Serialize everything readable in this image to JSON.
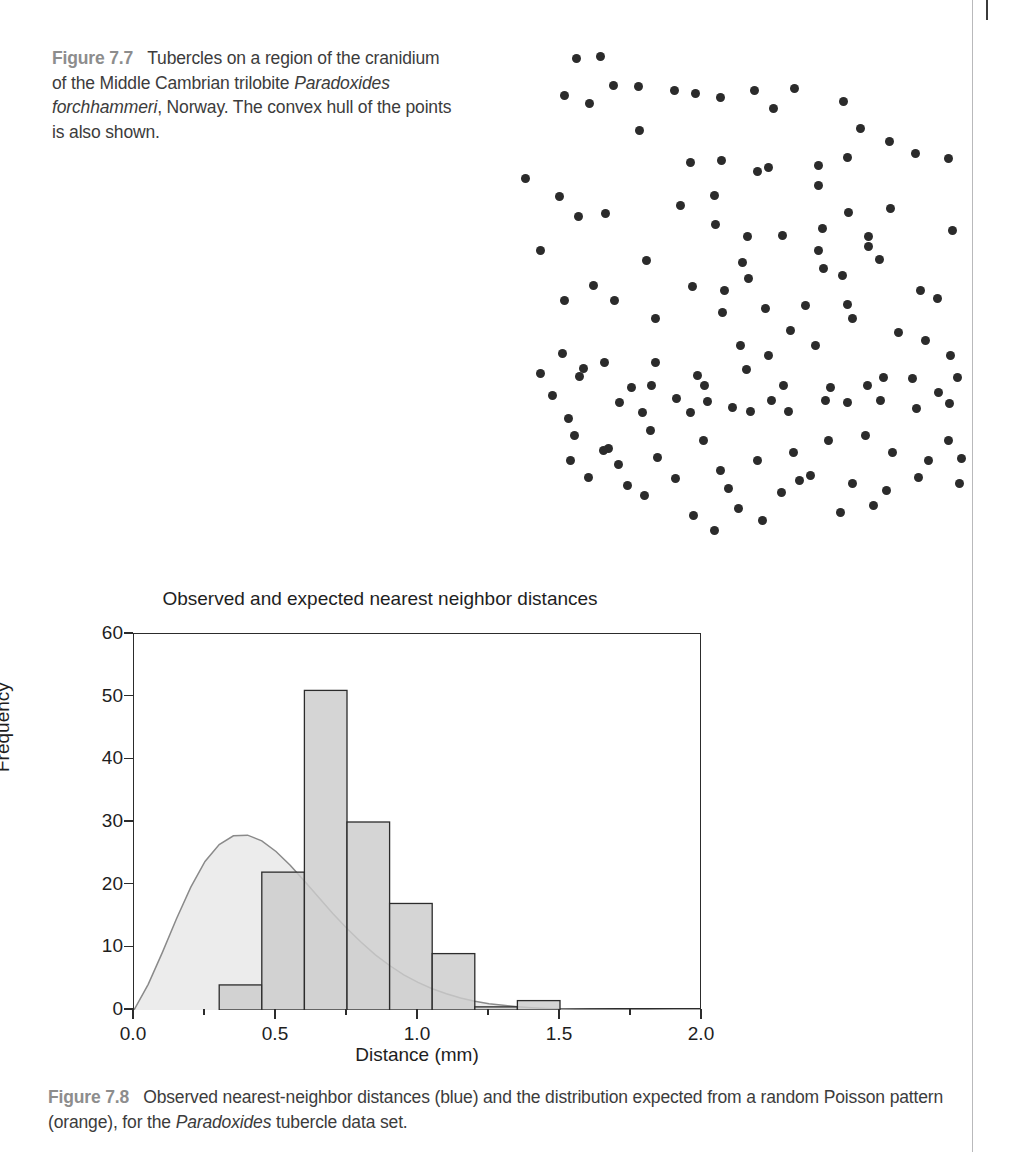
{
  "figure_77": {
    "label": "Figure 7.7",
    "caption_part1": "Tubercles on a region of the cranidium of the Middle Cambrian trilobite ",
    "caption_species": "Paradoxides forchhammeri",
    "caption_part2": ", Norway. The convex hull of the points is also shown.",
    "point_color": "#2b2b2b",
    "points": [
      [
        76,
        18
      ],
      [
        100,
        16
      ],
      [
        113,
        45
      ],
      [
        138,
        46
      ],
      [
        64,
        55
      ],
      [
        89,
        63
      ],
      [
        139,
        90
      ],
      [
        174,
        50
      ],
      [
        195,
        53
      ],
      [
        220,
        57
      ],
      [
        254,
        50
      ],
      [
        273,
        68
      ],
      [
        294,
        48
      ],
      [
        343,
        61
      ],
      [
        25,
        138
      ],
      [
        190,
        122
      ],
      [
        221,
        120
      ],
      [
        257,
        131
      ],
      [
        268,
        127
      ],
      [
        318,
        125
      ],
      [
        347,
        117
      ],
      [
        360,
        88
      ],
      [
        389,
        101
      ],
      [
        415,
        113
      ],
      [
        448,
        118
      ],
      [
        59,
        156
      ],
      [
        318,
        145
      ],
      [
        390,
        168
      ],
      [
        78,
        176
      ],
      [
        105,
        173
      ],
      [
        180,
        165
      ],
      [
        214,
        155
      ],
      [
        215,
        184
      ],
      [
        247,
        196
      ],
      [
        282,
        195
      ],
      [
        322,
        188
      ],
      [
        348,
        172
      ],
      [
        368,
        196
      ],
      [
        452,
        190
      ],
      [
        40,
        210
      ],
      [
        242,
        222
      ],
      [
        318,
        210
      ],
      [
        368,
        206
      ],
      [
        146,
        220
      ],
      [
        224,
        250
      ],
      [
        248,
        238
      ],
      [
        323,
        228
      ],
      [
        342,
        235
      ],
      [
        379,
        219
      ],
      [
        192,
        246
      ],
      [
        64,
        260
      ],
      [
        93,
        245
      ],
      [
        114,
        260
      ],
      [
        155,
        278
      ],
      [
        222,
        272
      ],
      [
        265,
        268
      ],
      [
        305,
        265
      ],
      [
        347,
        264
      ],
      [
        352,
        278
      ],
      [
        420,
        250
      ],
      [
        437,
        258
      ],
      [
        290,
        290
      ],
      [
        315,
        305
      ],
      [
        398,
        292
      ],
      [
        240,
        305
      ],
      [
        268,
        315
      ],
      [
        155,
        322
      ],
      [
        83,
        328
      ],
      [
        62,
        313
      ],
      [
        79,
        336
      ],
      [
        104,
        322
      ],
      [
        151,
        345
      ],
      [
        197,
        335
      ],
      [
        246,
        329
      ],
      [
        283,
        345
      ],
      [
        330,
        347
      ],
      [
        367,
        345
      ],
      [
        383,
        337
      ],
      [
        412,
        338
      ],
      [
        425,
        300
      ],
      [
        450,
        315
      ],
      [
        131,
        347
      ],
      [
        176,
        358
      ],
      [
        204,
        345
      ],
      [
        232,
        367
      ],
      [
        40,
        333
      ],
      [
        119,
        362
      ],
      [
        142,
        372
      ],
      [
        150,
        390
      ],
      [
        207,
        361
      ],
      [
        271,
        360
      ],
      [
        288,
        371
      ],
      [
        347,
        362
      ],
      [
        380,
        360
      ],
      [
        438,
        352
      ],
      [
        457,
        337
      ],
      [
        449,
        363
      ],
      [
        52,
        355
      ],
      [
        68,
        378
      ],
      [
        74,
        395
      ],
      [
        108,
        408
      ],
      [
        190,
        372
      ],
      [
        250,
        371
      ],
      [
        325,
        360
      ],
      [
        365,
        395
      ],
      [
        416,
        368
      ],
      [
        70,
        420
      ],
      [
        103,
        410
      ],
      [
        118,
        424
      ],
      [
        157,
        417
      ],
      [
        203,
        400
      ],
      [
        220,
        430
      ],
      [
        257,
        420
      ],
      [
        293,
        412
      ],
      [
        310,
        435
      ],
      [
        328,
        400
      ],
      [
        392,
        412
      ],
      [
        428,
        420
      ],
      [
        448,
        400
      ],
      [
        461,
        418
      ],
      [
        88,
        437
      ],
      [
        127,
        445
      ],
      [
        144,
        455
      ],
      [
        175,
        438
      ],
      [
        228,
        448
      ],
      [
        238,
        468
      ],
      [
        281,
        452
      ],
      [
        299,
        440
      ],
      [
        352,
        443
      ],
      [
        386,
        450
      ],
      [
        418,
        437
      ],
      [
        459,
        443
      ],
      [
        193,
        475
      ],
      [
        214,
        490
      ],
      [
        262,
        480
      ],
      [
        340,
        472
      ],
      [
        373,
        465
      ]
    ]
  },
  "chart_data": {
    "type": "bar",
    "title": "Observed and expected nearest neighbor distances",
    "xlabel": "Distance (mm)",
    "ylabel": "Frequency",
    "xlim": [
      0.0,
      2.0
    ],
    "ylim": [
      0,
      60
    ],
    "grid": false,
    "legend_position": "none",
    "x_tick_labels": [
      "0.0",
      "0.5",
      "1.0",
      "1.5",
      "2.0"
    ],
    "x_tick_values": [
      0.0,
      0.5,
      1.0,
      1.5,
      2.0
    ],
    "x_minor_tick_values": [
      0.25,
      0.75,
      1.25,
      1.75
    ],
    "y_tick_labels": [
      "0",
      "10",
      "20",
      "30",
      "40",
      "50",
      "60"
    ],
    "y_tick_values": [
      0,
      10,
      20,
      30,
      40,
      50,
      60
    ],
    "bar_fill_color": "#cccccc",
    "bar_edge_color": "#2c2c2c",
    "curve_fill_color": "#ececec",
    "curve_line_color": "#8a8a8a",
    "bin_width": 0.15,
    "bin_edges": [
      0.3,
      0.45,
      0.6,
      0.75,
      0.9,
      1.05,
      1.2,
      1.35,
      1.5
    ],
    "categories": [
      "0.30-0.45",
      "0.45-0.60",
      "0.60-0.75",
      "0.75-0.90",
      "0.90-1.05",
      "1.05-1.20",
      "1.20-1.35",
      "1.35-1.50"
    ],
    "values": [
      4,
      22,
      51,
      30,
      17,
      9,
      0.5,
      1.5
    ],
    "series": [
      {
        "name": "Observed nearest-neighbor distances",
        "type": "bar",
        "values": [
          4,
          22,
          51,
          30,
          17,
          9,
          0.5,
          1.5
        ]
      },
      {
        "name": "Expected from random Poisson pattern",
        "type": "area",
        "x": [
          0.0,
          0.05,
          0.1,
          0.15,
          0.2,
          0.25,
          0.3,
          0.35,
          0.4,
          0.45,
          0.5,
          0.55,
          0.6,
          0.65,
          0.7,
          0.75,
          0.8,
          0.85,
          0.9,
          0.95,
          1.0,
          1.05,
          1.1,
          1.15,
          1.2,
          1.25,
          1.3,
          1.35,
          1.4,
          1.45,
          1.5,
          1.6,
          1.7,
          1.8,
          1.9,
          2.0
        ],
        "y": [
          0.0,
          4.1,
          9.2,
          14.6,
          19.6,
          23.7,
          26.4,
          27.8,
          27.9,
          27.0,
          25.3,
          23.1,
          20.6,
          18.0,
          15.4,
          13.0,
          10.8,
          8.8,
          7.1,
          5.6,
          4.4,
          3.4,
          2.6,
          1.9,
          1.4,
          1.0,
          0.75,
          0.52,
          0.36,
          0.25,
          0.17,
          0.08,
          0.04,
          0.02,
          0.01,
          0.0
        ]
      }
    ]
  },
  "figure_78": {
    "label": "Figure 7.8",
    "caption": "Observed nearest-neighbor distances (blue) and the distribution expected from a random Poisson pattern (orange), for the ",
    "caption_species": "Paradoxides",
    "caption_tail": " tubercle data set."
  }
}
